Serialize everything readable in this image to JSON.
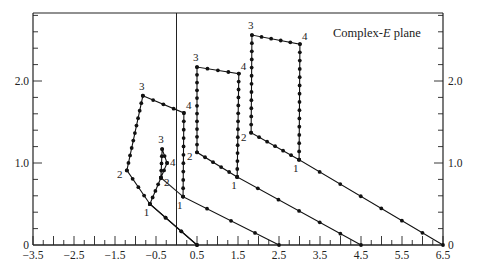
{
  "chart_data": {
    "type": "line",
    "title": "Complex-E plane",
    "title_parts": [
      "Complex-",
      "E",
      " plane"
    ],
    "xlabel": "",
    "ylabel": "",
    "xlim": [
      -3.5,
      6.5
    ],
    "ylim": [
      0,
      2.7
    ],
    "x_tick_labels": [
      "-3.5",
      "-2.5",
      "-1.5",
      "-0.5",
      "0.5",
      "1.5",
      "2.5",
      "3.5",
      "4.5",
      "5.5",
      "6.5"
    ],
    "x_tick_values": [
      -3.5,
      -2.5,
      -1.5,
      -0.5,
      0.5,
      1.5,
      2.5,
      3.5,
      4.5,
      5.5,
      6.5
    ],
    "x_minor_step": 0.25,
    "y_tick_labels": [
      "0",
      "1.0",
      "2.0"
    ],
    "y_tick_values": [
      0,
      1.0,
      2.0
    ],
    "y_minor_step": 0.2,
    "right_axis_labels": [
      "0",
      "1.0",
      "2.0"
    ],
    "vertical_line_x": 0,
    "grid": false,
    "legend": null,
    "series": [
      {
        "name": "contour-A",
        "start": [
          0.5,
          0
        ],
        "points": [
          [
            0.5,
            0
          ],
          [
            -0.65,
            0.5
          ],
          [
            -0.38,
            0.82
          ],
          [
            -0.35,
            1.17
          ],
          [
            -0.23,
            1.0
          ],
          [
            -0.38,
            0.82
          ]
        ],
        "labels": {
          "1": [
            -0.65,
            0.5
          ],
          "2": [
            -0.38,
            0.82
          ],
          "3": [
            -0.35,
            1.17
          ],
          "4": [
            -0.23,
            1.0
          ]
        }
      },
      {
        "name": "contour-B",
        "start": [
          2.5,
          0
        ],
        "points": [
          [
            2.5,
            0
          ],
          [
            0.16,
            0.59
          ],
          [
            0.18,
            1.61
          ],
          [
            -0.82,
            1.82
          ],
          [
            -1.21,
            0.91
          ],
          [
            -0.65,
            0.5
          ],
          [
            0.5,
            0
          ]
        ],
        "labels": {
          "1": [
            0.16,
            0.59
          ],
          "2": [
            -1.21,
            0.91
          ],
          "3": [
            -0.82,
            1.82
          ],
          "4": [
            0.18,
            1.61
          ]
        }
      },
      {
        "name": "contour-C",
        "start": [
          4.5,
          0
        ],
        "points": [
          [
            4.5,
            0
          ],
          [
            1.48,
            0.83
          ],
          [
            1.52,
            2.09
          ],
          [
            0.5,
            2.17
          ],
          [
            0.5,
            1.13
          ],
          [
            1.48,
            0.83
          ]
        ],
        "labels": {
          "1": [
            1.48,
            0.83
          ],
          "2": [
            0.5,
            1.13
          ],
          "3": [
            0.5,
            2.17
          ],
          "4": [
            1.52,
            2.09
          ]
        }
      },
      {
        "name": "contour-D",
        "start": [
          6.5,
          0
        ],
        "points": [
          [
            6.5,
            0
          ],
          [
            2.99,
            1.04
          ],
          [
            3.01,
            2.45
          ],
          [
            1.84,
            2.56
          ],
          [
            1.82,
            1.37
          ],
          [
            2.99,
            1.04
          ]
        ],
        "labels": {
          "1": [
            2.99,
            1.04
          ],
          "2": [
            1.82,
            1.37
          ],
          "3": [
            1.84,
            2.56
          ],
          "4": [
            3.01,
            2.45
          ]
        }
      }
    ],
    "extra_segments": [
      {
        "from": [
          -0.38,
          0.82
        ],
        "to": [
          0.16,
          0.59
        ]
      }
    ]
  }
}
